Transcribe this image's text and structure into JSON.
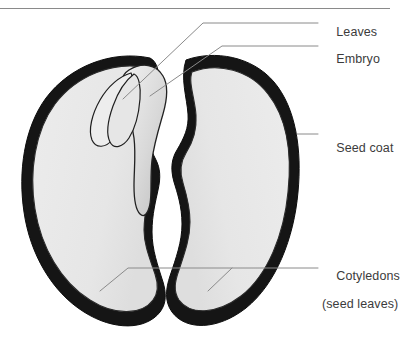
{
  "figure": {
    "width": 415,
    "height": 350,
    "background_color": "#ffffff",
    "top_rule_color": "#8a8a8a"
  },
  "style": {
    "label_color": "#3b3b3b",
    "leader_color": "#8a8a8a",
    "seed_coat_color": "#1a1a1a",
    "cotyledon_fill": "#e9e9e9",
    "cotyledon_outline": "#2b2b2b",
    "embryo_fill": "#dcdcdc",
    "embryo_outline": "#222222",
    "leaf_fill": "#ededed",
    "leaf_outline": "#1f1f1f"
  },
  "labels": [
    {
      "id": "leaves",
      "text": "Leaves",
      "line2": "",
      "points_to": "embryonic leaves (plumule) at upper left of embryo"
    },
    {
      "id": "embryo",
      "text": "Embryo",
      "line2": "",
      "points_to": "hypocotyl and radicle region of the embryo"
    },
    {
      "id": "seed-coat",
      "text": "Seed coat",
      "line2": "",
      "points_to": "thick dark outer layer of the right cotyledon half"
    },
    {
      "id": "cotyledons",
      "text": "Cotyledons",
      "line2": "(seed leaves)",
      "points_to": "both large fleshy halves of the seed"
    }
  ],
  "parts": [
    {
      "id": "left-cotyledon",
      "name": "Left cotyledon"
    },
    {
      "id": "right-cotyledon",
      "name": "Right cotyledon"
    },
    {
      "id": "embryo-body",
      "name": "Embryo"
    },
    {
      "id": "embryonic-leaves",
      "name": "Leaves"
    },
    {
      "id": "seed-coat-layer",
      "name": "Seed coat"
    }
  ]
}
